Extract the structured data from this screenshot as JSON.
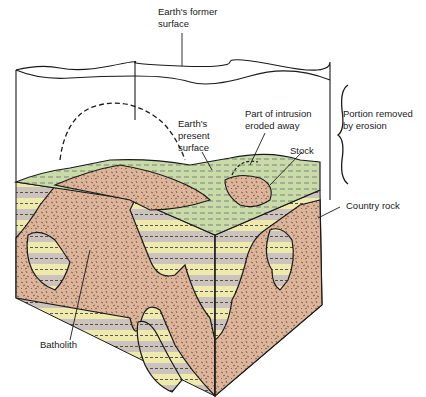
{
  "diagram": {
    "colors": {
      "country_rock_light": "#eeeaae",
      "country_rock_grey": "#cbc3bc",
      "intrusion": "#dcb59a",
      "surface_green": "#c9dba9",
      "outline": "#1a1a1a"
    },
    "labels": {
      "former_surface": [
        "Earth's former",
        "surface"
      ],
      "present_surface": [
        "Earth's",
        "present",
        "surface"
      ],
      "eroded": [
        "Part of intrusion",
        "eroded away"
      ],
      "portion_removed": [
        "Portion removed",
        "by erosion"
      ],
      "stock": "Stock",
      "country_rock": "Country rock",
      "batholith": "Batholith"
    }
  }
}
